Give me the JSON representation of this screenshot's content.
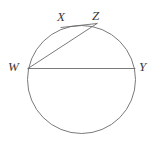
{
  "figure": {
    "kind": "circle-geometry-diagram",
    "stroke_color": "#6b6b6b",
    "label_color": "#3a3a3a",
    "background_color": "#ffffff",
    "stroke_width": 0.9,
    "circle": {
      "center_x": 81.5,
      "center_y": 79.5,
      "radius": 54.0
    },
    "points": [
      {
        "id": "W",
        "label": "W",
        "x": 28.0,
        "y": 76.0
      },
      {
        "id": "X",
        "label": "X",
        "x": 62.0,
        "y": 26.5
      },
      {
        "id": "Z",
        "label": "Z",
        "x": 97.0,
        "y": 23.5
      },
      {
        "id": "Y",
        "label": "Y",
        "x": 135.0,
        "y": 68.5
      }
    ],
    "segments": [
      {
        "id": "WY",
        "from": "W",
        "to": "Y",
        "kind": "diameter",
        "x1": 28.0,
        "y1": 68.5,
        "x2": 135.0,
        "y2": 68.5
      },
      {
        "id": "WZ",
        "from": "W",
        "to": "Z",
        "kind": "chord",
        "x1": 28.0,
        "y1": 68.5,
        "x2": 97.0,
        "y2": 23.5
      },
      {
        "id": "XZ",
        "from": "X",
        "to": "Z",
        "kind": "chord",
        "x1": 61.0,
        "y1": 27.5,
        "x2": 97.0,
        "y2": 23.5
      }
    ],
    "labels": {
      "w": "W",
      "x": "X",
      "z": "Z",
      "y": "Y"
    }
  }
}
